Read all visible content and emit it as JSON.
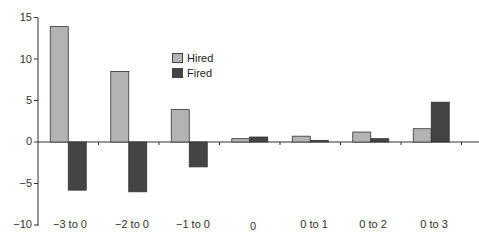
{
  "chart_data": {
    "type": "bar",
    "title": "",
    "xlabel": "",
    "ylabel": "",
    "ylim": [
      -10,
      15
    ],
    "yticks": [
      15,
      10,
      5,
      0,
      -5,
      -10
    ],
    "grid": false,
    "legend_position": "upper-left-inside",
    "categories": [
      "−3 to 0",
      "−2 to 0",
      "−1 to 0",
      "0",
      "0 to 1",
      "0 to 2",
      "0 to 3"
    ],
    "series": [
      {
        "name": "Hired",
        "color": "#b3b3b3",
        "values": [
          13.9,
          8.5,
          3.9,
          0.4,
          0.7,
          1.2,
          1.6
        ]
      },
      {
        "name": "Fired",
        "color": "#444444",
        "values": [
          -5.8,
          -6.0,
          -3.0,
          0.6,
          0.2,
          0.4,
          4.8
        ]
      }
    ]
  },
  "legend": {
    "hired": "Hired",
    "fired": "Fired"
  },
  "y_ticks": {
    "t15": "15",
    "t10": "10",
    "t5": "5",
    "t0": "0",
    "tm5": "−5",
    "tm10": "−10"
  },
  "x_labels": {
    "c0": "−3 to 0",
    "c1": "−2 to 0",
    "c2": "−1 to 0",
    "c3": "0",
    "c4": "0 to 1",
    "c5": "0 to 2",
    "c6": "0 to 3"
  }
}
